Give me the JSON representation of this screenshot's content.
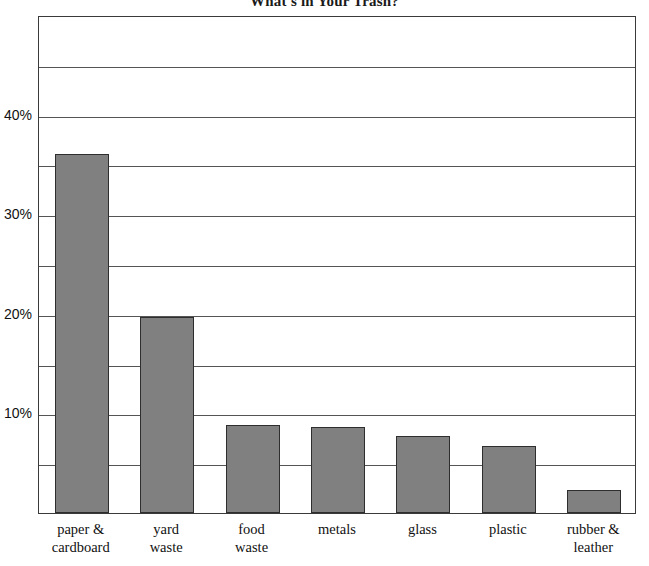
{
  "chart_data": {
    "type": "bar",
    "title": "What's in Your Trash?",
    "xlabel": "",
    "ylabel": "",
    "ylim": [
      0,
      50
    ],
    "ytick_values": [
      10,
      20,
      30,
      40
    ],
    "ytick_labels": [
      "10%",
      "20%",
      "30%",
      "40%"
    ],
    "gridlines": [
      5,
      10,
      15,
      20,
      25,
      30,
      35,
      40,
      45,
      50
    ],
    "grid": true,
    "legend": "none",
    "categories": [
      "paper & cardboard",
      "yard waste",
      "food waste",
      "metals",
      "glass",
      "plastic",
      "rubber & leather"
    ],
    "category_lines": [
      [
        "paper &",
        "cardboard"
      ],
      [
        "yard",
        "waste"
      ],
      [
        "food",
        "waste"
      ],
      [
        "metals"
      ],
      [
        "glass"
      ],
      [
        "plastic"
      ],
      [
        "rubber &",
        "leather"
      ]
    ],
    "values": [
      36.0,
      19.7,
      8.8,
      8.6,
      7.7,
      6.7,
      2.3
    ],
    "bar_color": "#808080",
    "bar_edge_color": "#2e2e2e",
    "grid_color": "#555555",
    "frame_color": "#3a3a3a",
    "background_color": "#ffffff"
  }
}
